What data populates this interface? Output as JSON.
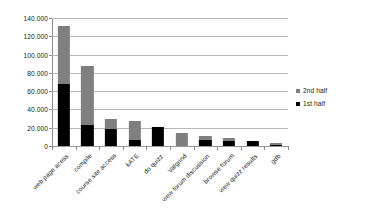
{
  "chart_data": {
    "type": "bar",
    "stacked": true,
    "title": "",
    "subtitle": "",
    "xlabel": "",
    "ylabel": "",
    "grid": true,
    "legend_position": "right",
    "ylim": [
      0,
      140000
    ],
    "ytick_step": 20000,
    "ytick_labels": [
      "140.000",
      "120.000",
      "100.000",
      "80.000",
      "60.000",
      "40.000",
      "20.000",
      "0"
    ],
    "ytick_values": [
      140000,
      120000,
      100000,
      80000,
      60000,
      40000,
      20000,
      0
    ],
    "categories": [
      "web page acess",
      "compile",
      "course site access",
      "kATE",
      "do quizz",
      "Valgrind",
      "view forum discussion",
      "browse forum",
      "view quizz results",
      "gdb"
    ],
    "series": [
      {
        "name": "1st half",
        "color": "#000000",
        "values": [
          68000,
          23000,
          19000,
          7000,
          21000,
          0,
          7000,
          6000,
          5000,
          1500
        ]
      },
      {
        "name": "2nd half",
        "color": "#7f7f7f",
        "values": [
          63000,
          64000,
          11000,
          20000,
          0,
          14000,
          4000,
          2500,
          0,
          1500
        ]
      }
    ],
    "totals": [
      131000,
      87000,
      30000,
      27000,
      21000,
      14000,
      11000,
      8500,
      5000,
      3000
    ]
  },
  "legend": {
    "items": [
      {
        "label": "2nd half",
        "swatch": "second"
      },
      {
        "label": "1st half",
        "swatch": "first"
      }
    ]
  }
}
